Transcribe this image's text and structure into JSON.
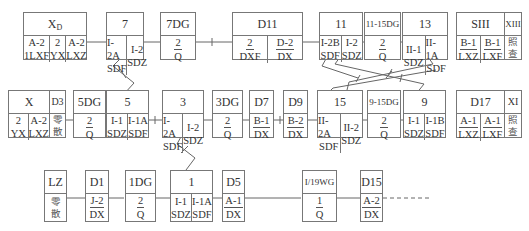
{
  "diagram": {
    "rows": [
      {
        "boxes": [
          {
            "id": "XD",
            "header": "X",
            "header_sub": "D",
            "cells": [
              {
                "top": "A-2",
                "bottom": "1LXF"
              },
              {
                "top": "2",
                "bottom": "YX"
              },
              {
                "top": "A-2",
                "bottom": "LXZ"
              }
            ]
          },
          {
            "id": "7",
            "header": "7",
            "cells": [
              {
                "top": "I-2A",
                "bottom": "SDF"
              },
              {
                "top": "I-2",
                "bottom": "SDZ"
              }
            ]
          },
          {
            "id": "7DG",
            "header": "7DG",
            "cells": [
              {
                "top": "2",
                "bottom": "Q"
              }
            ]
          },
          {
            "id": "D11",
            "header": "D11",
            "cells": [
              {
                "top": "2",
                "bottom": "DXF"
              },
              {
                "top": "D-2",
                "bottom": "DX"
              }
            ]
          },
          {
            "id": "11",
            "header": "11",
            "cells": [
              {
                "top": "I-2B",
                "bottom": "SDF"
              },
              {
                "top": "I-2",
                "bottom": "SDZ"
              }
            ]
          },
          {
            "id": "11-15DG",
            "header": "11-15DG",
            "cells": [
              {
                "top": "2",
                "bottom": "Q"
              }
            ]
          },
          {
            "id": "13",
            "header": "13",
            "cells": [
              {
                "top": "II-1",
                "bottom": "SDZ"
              },
              {
                "top": "II-1A",
                "bottom": "SDF"
              }
            ]
          },
          {
            "id": "SIII",
            "header": "SIII",
            "cells": [
              {
                "top": "B-1",
                "bottom": "LXZ"
              },
              {
                "top": "B-1",
                "bottom": "LXF"
              }
            ],
            "side_header": "XIII",
            "side_text": [
              "照",
              "查"
            ]
          }
        ]
      },
      {
        "boxes": [
          {
            "id": "X",
            "header": "X",
            "cells": [
              {
                "top": "2",
                "bottom": "YX"
              },
              {
                "top": "A-2",
                "bottom": "LXZ"
              }
            ],
            "side_header": "D3",
            "side_text": [
              "零",
              "散"
            ]
          },
          {
            "id": "5DG",
            "header": "5DG",
            "cells": [
              {
                "top": "2",
                "bottom": "Q"
              }
            ]
          },
          {
            "id": "5",
            "header": "5",
            "cells": [
              {
                "top": "I-1",
                "bottom": "SDZ"
              },
              {
                "top": "I-1A",
                "bottom": "SDF"
              }
            ]
          },
          {
            "id": "3",
            "header": "3",
            "cells": [
              {
                "top": "I-2A",
                "bottom": "SDF"
              },
              {
                "top": "I-2",
                "bottom": "SDZ"
              }
            ]
          },
          {
            "id": "3DG",
            "header": "3DG",
            "cells": [
              {
                "top": "2",
                "bottom": "Q"
              }
            ]
          },
          {
            "id": "D7",
            "header": "D7",
            "cells": [
              {
                "top": "B-1",
                "bottom": "DX"
              }
            ]
          },
          {
            "id": "D9",
            "header": "D9",
            "cells": [
              {
                "top": "B-2",
                "bottom": "DX"
              }
            ]
          },
          {
            "id": "15",
            "header": "15",
            "cells": [
              {
                "top": "II-2A",
                "bottom": "SDF"
              },
              {
                "top": "II-2",
                "bottom": "SDZ"
              }
            ]
          },
          {
            "id": "9-15DG",
            "header": "9-15DG",
            "cells": [
              {
                "top": "2",
                "bottom": "Q"
              }
            ]
          },
          {
            "id": "9",
            "header": "9",
            "cells": [
              {
                "top": "I-1",
                "bottom": "SDZ"
              },
              {
                "top": "I-1B",
                "bottom": "SDF"
              }
            ]
          },
          {
            "id": "D17",
            "header": "D17",
            "cells": [
              {
                "top": "A-1",
                "bottom": "LXZ"
              },
              {
                "top": "A-1",
                "bottom": "LXF"
              }
            ],
            "side_header": "XI",
            "side_text": [
              "照",
              "查"
            ]
          }
        ]
      },
      {
        "boxes": [
          {
            "id": "LZ",
            "header": "LZ",
            "text": [
              "零",
              "散"
            ]
          },
          {
            "id": "D1",
            "header": "D1",
            "cells": [
              {
                "top": "J-2",
                "bottom": "DX"
              }
            ]
          },
          {
            "id": "1DG",
            "header": "1DG",
            "cells": [
              {
                "top": "2",
                "bottom": "Q"
              }
            ]
          },
          {
            "id": "1",
            "header": "1",
            "cells": [
              {
                "top": "I-1",
                "bottom": "SDZ"
              },
              {
                "top": "I-1A",
                "bottom": "SDF"
              }
            ]
          },
          {
            "id": "D5",
            "header": "D5",
            "cells": [
              {
                "top": "A-1",
                "bottom": "DX"
              }
            ]
          },
          {
            "id": "I/19WG",
            "header": "I/19WG",
            "cells": [
              {
                "top": "1",
                "bottom": "Q"
              }
            ]
          },
          {
            "id": "D15",
            "header": "D15",
            "cells": [
              {
                "top": "A-2",
                "bottom": "DX"
              }
            ]
          }
        ]
      }
    ]
  }
}
